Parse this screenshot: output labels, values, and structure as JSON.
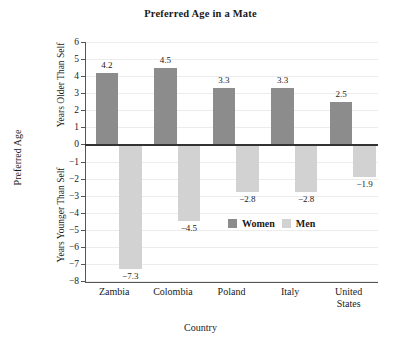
{
  "chart_data": {
    "type": "bar",
    "title": "Preferred Age in a Mate",
    "xlabel": "Country",
    "ylabel": "Preferred Age",
    "ylabel_upper": "Years Older Than Self",
    "ylabel_lower": "Years Younger Than Self",
    "categories": [
      "Zambia",
      "Colombia",
      "Poland",
      "Italy",
      "United States"
    ],
    "category_lines": [
      [
        "Zambia"
      ],
      [
        "Colombia"
      ],
      [
        "Poland"
      ],
      [
        "Italy"
      ],
      [
        "United",
        "States"
      ]
    ],
    "series": [
      {
        "name": "Women",
        "color": "#8c8c8c",
        "values": [
          4.2,
          4.5,
          3.3,
          3.3,
          2.5
        ],
        "labels": [
          "4.2",
          "4.5",
          "3.3",
          "3.3",
          "2.5"
        ]
      },
      {
        "name": "Men",
        "color": "#d2d2d2",
        "values": [
          -7.3,
          -4.5,
          -2.8,
          -2.8,
          -1.9
        ],
        "labels": [
          "−7.3",
          "−4.5",
          "−2.8",
          "−2.8",
          "−1.9"
        ]
      }
    ],
    "ylim": [
      -8,
      6
    ],
    "yticks": [
      6,
      5,
      4,
      3,
      2,
      1,
      0,
      -1,
      -2,
      -3,
      -4,
      -5,
      -6,
      -7,
      -8
    ],
    "ytick_labels": [
      "6",
      "5",
      "4",
      "3",
      "2",
      "1",
      "0",
      "−1",
      "−2",
      "−3",
      "−4",
      "−5",
      "−6",
      "−7",
      "−8"
    ],
    "grid": true,
    "legend_position": "inside-lower-right"
  }
}
